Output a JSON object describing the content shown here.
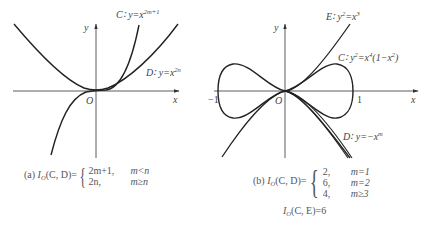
{
  "panel_a": {
    "axis_x_label": "x",
    "axis_y_label": "y",
    "origin_label": "O",
    "curve_c": {
      "name": "C",
      "eq_prefix": "C∶ y=x",
      "exponent": "2m+1"
    },
    "curve_d": {
      "name": "D",
      "eq_prefix": "D∶ y=x",
      "exponent": "2n"
    },
    "caption": {
      "tag": "(a)",
      "lhs": "I",
      "lhs_sub": "O",
      "lhs_args": "(C, D)=",
      "cases": [
        {
          "value": "2m+1,",
          "condition": "m<n"
        },
        {
          "value": "2n,",
          "condition": "m≥n"
        }
      ]
    }
  },
  "panel_b": {
    "axis_x_label": "x",
    "axis_y_label": "y",
    "origin_label": "O",
    "tick_neg_one": "−1",
    "tick_one": "1",
    "curve_e": {
      "name": "E",
      "eq_prefix": "E∶ y",
      "exp_y": "2",
      "eq_mid": "=x",
      "exp_x": "3"
    },
    "curve_c": {
      "name": "C",
      "eq_prefix": "C∶ y",
      "exp_y": "2",
      "eq_mid": "=x",
      "exp_x": "4",
      "eq_tail": "(1−x",
      "exp_tail": "2",
      "eq_end": ")"
    },
    "curve_d": {
      "name": "D",
      "eq_prefix": "D∶ y=−x",
      "exponent": "m"
    },
    "caption": {
      "tag": "(b)",
      "lhs": "I",
      "lhs_sub": "O",
      "lhs_args": "(C, D)=",
      "cases": [
        {
          "value": "2,",
          "condition": "m=1"
        },
        {
          "value": "6,",
          "condition": "m=2"
        },
        {
          "value": "4,",
          "condition": "m≥3"
        }
      ],
      "second_line": {
        "lhs": "I",
        "lhs_sub": "O",
        "rest": "(C, E)=6"
      }
    }
  },
  "colors": {
    "curve": "#222222",
    "axis": "#333333",
    "text": "#444444"
  }
}
